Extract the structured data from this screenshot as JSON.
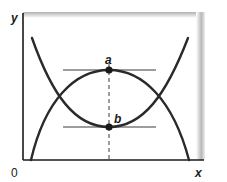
{
  "diagram": {
    "axes": {
      "x_label": "x",
      "y_label": "y",
      "origin_label": "0"
    },
    "curves": [
      {
        "name": "u-shaped-curve",
        "shape": "convex",
        "minimum_point": "b"
      },
      {
        "name": "arch-curve",
        "shape": "concave",
        "maximum_point": "a"
      }
    ],
    "points": [
      {
        "id": "a",
        "label": "a",
        "description": "maximum of arch curve, tangent line horizontal"
      },
      {
        "id": "b",
        "label": "b",
        "description": "minimum of U-shaped curve, tangent line horizontal"
      }
    ],
    "tangent_lines": [
      "a",
      "b"
    ],
    "dashed_vertical_through": [
      "a",
      "b"
    ],
    "colors": {
      "curve": "#2a2a2a",
      "tangent": "#3a3a3a",
      "axis": "#1a1a1a",
      "frame_shade": "#b8b8b8",
      "background": "#ffffff"
    }
  }
}
